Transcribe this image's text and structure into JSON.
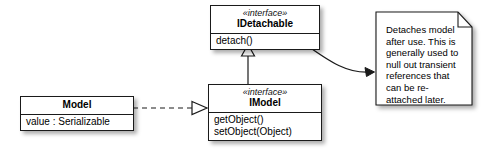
{
  "diagram": {
    "background_color": "#ffffff",
    "line_color": "#1a1a1a",
    "box_fill": "#ffffff"
  },
  "classes": [
    {
      "id": "model",
      "name": "Model",
      "stereotype": "",
      "attributes": [
        "value : Serializable"
      ],
      "operations": []
    },
    {
      "id": "imodel",
      "name": "IModel",
      "stereotype": "«interface»",
      "attributes": [],
      "operations": [
        "getObject()",
        "setObject(Object)"
      ]
    },
    {
      "id": "idetachable",
      "name": "IDetachable",
      "stereotype": "«interface»",
      "attributes": [],
      "operations": [
        "detach()"
      ]
    }
  ],
  "note": {
    "text": "Detaches model after use. This is generally used to null out transient references that can be re-attached later.",
    "lines": [
      "Detaches model",
      "after use. This is",
      "generally used to",
      "null out transient",
      "references that",
      "can be re-",
      "attached later."
    ]
  },
  "relationships": [
    {
      "id": "realization",
      "from": "Model",
      "to": "IModel",
      "type": "realization",
      "line_style": "dashed",
      "arrowhead": "hollow-triangle"
    },
    {
      "id": "generalization",
      "from": "IModel",
      "to": "IDetachable",
      "type": "generalization",
      "line_style": "solid",
      "arrowhead": "hollow-triangle"
    },
    {
      "id": "note-anchor",
      "from": "IDetachable",
      "to": "note",
      "type": "note-link",
      "line_style": "solid-curved",
      "arrowhead": "filled-arrow"
    }
  ]
}
